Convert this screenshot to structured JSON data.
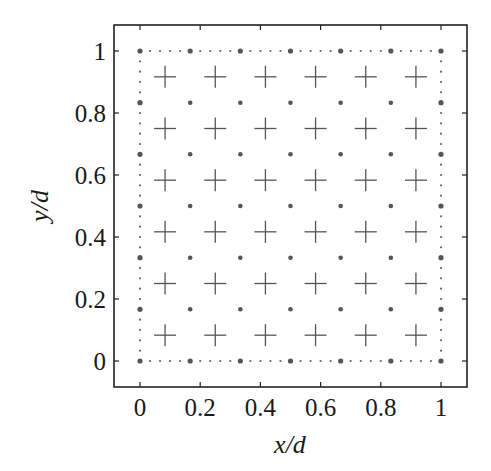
{
  "chart_data": {
    "type": "scatter",
    "title": "",
    "xlabel": "x/d",
    "ylabel": "y/d",
    "xlim": [
      -0.087,
      1.087
    ],
    "ylim": [
      -0.084,
      1.084
    ],
    "grid": false,
    "legend": null,
    "x_ticks": [
      0,
      0.2,
      0.4,
      0.6,
      0.8,
      1
    ],
    "x_tick_labels": [
      "0",
      "0.2",
      "0.4",
      "0.6",
      "0.8",
      "1"
    ],
    "y_ticks": [
      0,
      0.2,
      0.4,
      0.6,
      0.8,
      1
    ],
    "y_tick_labels": [
      "0",
      "0.2",
      "0.4",
      "0.6",
      "0.8",
      "1"
    ],
    "series": [
      {
        "name": "large dots (grid nodes)",
        "marker": "dot-large",
        "color": "#555555",
        "grid_values": [
          0,
          0.1667,
          0.3333,
          0.5,
          0.6667,
          0.8333,
          1
        ],
        "note": "7x7 lattice of points at x,y in multiples of 1/6"
      },
      {
        "name": "crosses (cell centers)",
        "marker": "plus",
        "color": "#555555",
        "grid_values": [
          0.0833,
          0.25,
          0.4167,
          0.5833,
          0.75,
          0.9167
        ],
        "note": "6x6 lattice at cell centers"
      },
      {
        "name": "small boundary dots",
        "marker": "dot-small",
        "color": "#666666",
        "note": "4 small dots between each pair of large dots along boundary x=0, x=1, y=0, y=1",
        "subdivisions": 5
      }
    ]
  },
  "layout": {
    "axes_box": {
      "left": 114,
      "top": 25,
      "right": 467,
      "bottom": 387
    },
    "data_origin_px": {
      "x0": 140,
      "x1": 441,
      "y0": 361,
      "y1": 51
    }
  },
  "labels": {
    "x": "x/d",
    "y": "y/d"
  }
}
